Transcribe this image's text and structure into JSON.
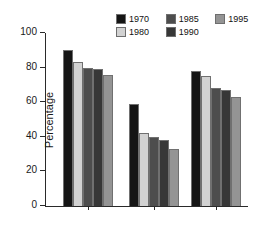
{
  "chart_data": {
    "type": "bar",
    "title": "",
    "subtitle": "",
    "xlabel": "",
    "ylabel": "Percentage",
    "categories": [
      "White",
      "Black",
      "Hispanic"
    ],
    "series": [
      {
        "name": "1970",
        "color": "#151515",
        "values": [
          90,
          59,
          78
        ]
      },
      {
        "name": "1980",
        "color": "#d2d2d2",
        "values": [
          83,
          42,
          75
        ]
      },
      {
        "name": "1985",
        "color": "#4d4d4d",
        "values": [
          80,
          40,
          68
        ]
      },
      {
        "name": "1990",
        "color": "#373737",
        "values": [
          79,
          38,
          67
        ]
      },
      {
        "name": "1995",
        "color": "#949494",
        "values": [
          76,
          33,
          63
        ]
      }
    ],
    "ylim": [
      0,
      100
    ],
    "yticks": [
      0,
      20,
      40,
      60,
      80,
      100
    ],
    "ytick_labels": [
      "0",
      "20",
      "40",
      "60",
      "80",
      "100"
    ],
    "grid": false,
    "legend_position": "top-right",
    "legend_columns": 3,
    "legend_rows": 2,
    "axis_color": "#2a2a2a",
    "background": "#ffffff"
  }
}
